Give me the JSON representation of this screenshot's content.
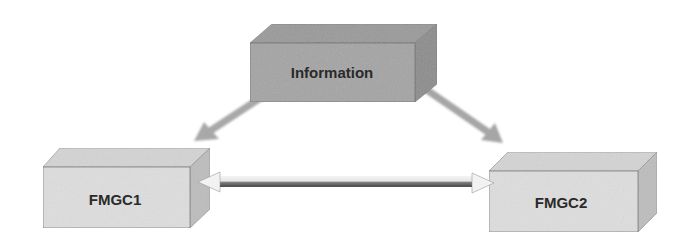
{
  "diagram": {
    "nodes": [
      {
        "id": "information",
        "label": "Information",
        "shade": "dark"
      },
      {
        "id": "fmgc1",
        "label": "FMGC1",
        "shade": "light"
      },
      {
        "id": "fmgc2",
        "label": "FMGC2",
        "shade": "light"
      }
    ],
    "edges": [
      {
        "from": "information",
        "to": "fmgc1",
        "type": "one-way"
      },
      {
        "from": "information",
        "to": "fmgc2",
        "type": "one-way"
      },
      {
        "from": "fmgc1",
        "to": "fmgc2",
        "type": "bidirectional"
      }
    ],
    "colors": {
      "dark_front": "#a4a4a4",
      "dark_top": "#9a9a9a",
      "dark_side": "#8c8c8c",
      "light_front": "#dedede",
      "light_top": "#d2d2d2",
      "light_side": "#bdbdbd",
      "arrow": "#a6a6a6",
      "edge": "#6e6e6e"
    }
  }
}
